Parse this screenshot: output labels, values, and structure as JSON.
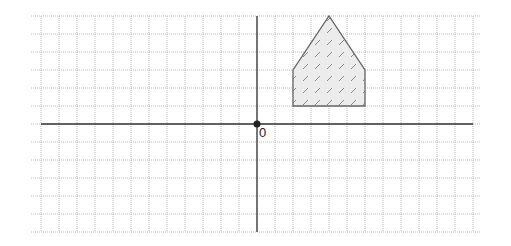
{
  "diagram": {
    "type": "coordinate-grid",
    "grid": {
      "cols_left": 12,
      "cols_right": 12,
      "rows_up": 6,
      "rows_down": 6,
      "cell_px": 18,
      "line_color": "#b9b9b9",
      "axis_color": "#333333"
    },
    "origin": {
      "label": "0",
      "px": [
        257,
        124
      ]
    },
    "shape": {
      "name": "pentagon",
      "vertices": [
        [
          2,
          1
        ],
        [
          6,
          1
        ],
        [
          6,
          3
        ],
        [
          4,
          6
        ],
        [
          2,
          3
        ]
      ],
      "fill": "#ececec",
      "stroke": "#666666",
      "hatch_color": "#8a8a8a"
    }
  }
}
